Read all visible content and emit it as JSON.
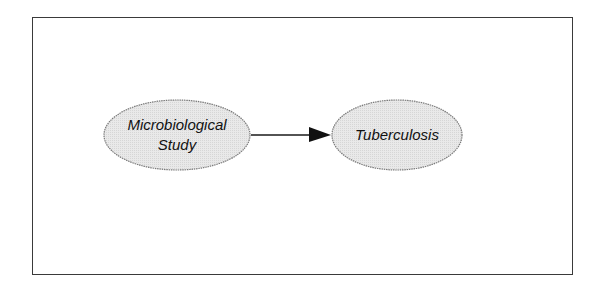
{
  "diagram": {
    "type": "directed-graph",
    "colors": {
      "frame_border": "#3a3a3a",
      "node_fill": "#e6e6e6",
      "node_stroke": "#7a7a7a",
      "edge": "#1a1a1a",
      "text": "#111111"
    },
    "nodes": [
      {
        "id": "microbiological-study",
        "label_line1": "Microbiological",
        "label_line2": "Study"
      },
      {
        "id": "tuberculosis",
        "label": "Tuberculosis"
      }
    ],
    "edges": [
      {
        "from": "microbiological-study",
        "to": "tuberculosis"
      }
    ]
  }
}
